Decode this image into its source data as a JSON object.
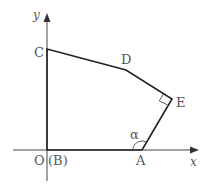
{
  "diagram": {
    "axes": {
      "x_label": "x",
      "y_label": "y",
      "origin_label": "O",
      "origin_alt_label": "(B)"
    },
    "points": {
      "C": {
        "label": "C",
        "x": 47,
        "y": 49
      },
      "D": {
        "label": "D",
        "x": 126,
        "y": 70
      },
      "E": {
        "label": "E",
        "x": 172,
        "y": 99
      },
      "A": {
        "label": "A",
        "x": 142,
        "y": 150
      },
      "O": {
        "label": "O",
        "x": 47,
        "y": 150
      }
    },
    "angle_label": "α",
    "right_angle_at": "E",
    "colors": {
      "line": "#222222",
      "axis": "#444444",
      "text": "#555555"
    }
  }
}
